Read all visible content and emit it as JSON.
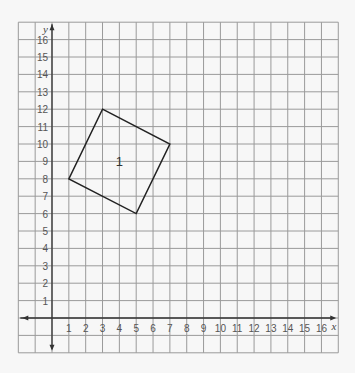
{
  "diagram": {
    "type": "coordinate-grid",
    "x_axis_label": "x",
    "y_axis_label": "y",
    "x_range": [
      -2,
      17
    ],
    "y_range": [
      -2,
      17
    ],
    "x_ticks": [
      1,
      2,
      3,
      4,
      5,
      6,
      7,
      8,
      9,
      10,
      11,
      12,
      13,
      14,
      15,
      16
    ],
    "y_ticks": [
      1,
      2,
      3,
      4,
      5,
      6,
      7,
      8,
      9,
      10,
      11,
      12,
      13,
      14,
      15,
      16
    ],
    "shape": {
      "label": "1",
      "label_position": [
        4,
        9
      ],
      "vertices": [
        [
          3,
          12
        ],
        [
          7,
          10
        ],
        [
          5,
          6
        ],
        [
          1,
          8
        ]
      ]
    },
    "colors": {
      "grid": "#9a9a9a",
      "axis": "#333333",
      "shape": "#222222",
      "background": "#f7f7f7"
    }
  }
}
